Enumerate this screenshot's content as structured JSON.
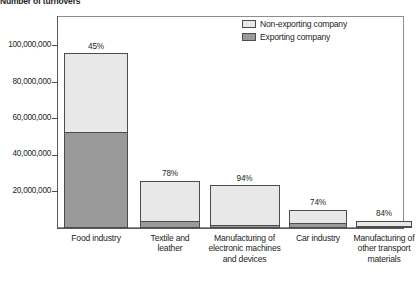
{
  "chart_data": {
    "type": "bar",
    "subtype": "stacked-vertical",
    "title": "Number of turnovers",
    "xlabel": "",
    "ylabel": "Number of turnovers",
    "ylim": [
      0,
      110000000
    ],
    "ytick_values": [
      20000000,
      40000000,
      60000000,
      80000000,
      100000000
    ],
    "ytick_labels": [
      "20,000,000",
      "40,000,000",
      "60,000,000",
      "80,000,000",
      "100,000,000"
    ],
    "grid": false,
    "legend_position": "top-right",
    "categories": [
      "Food industry",
      "Textile and leather",
      "Manufacturing of electronic machines and devices",
      "Car industry",
      "Manufacturing of other transport materials"
    ],
    "series": [
      {
        "name": "Non-exporting company",
        "color": "#e8e8e8",
        "values": [
          43000000,
          22700000,
          22100000,
          7400000,
          3400000
        ]
      },
      {
        "name": "Exporting company",
        "color": "#9a9a9a",
        "values": [
          53000000,
          3300000,
          1400000,
          2600000,
          600000
        ]
      }
    ],
    "totals": [
      96000000,
      26000000,
      23500000,
      10000000,
      4000000
    ],
    "data_labels": [
      "45%",
      "78%",
      "94%",
      "74%",
      "84%"
    ],
    "data_labels_meaning": "share of non-exporting company in total turnover"
  },
  "chart": {
    "title": "Number of turnovers",
    "y_axis": {
      "ticks": [
        {
          "label": "100,000,000",
          "value": 100000000
        },
        {
          "label": "80,000,000",
          "value": 80000000
        },
        {
          "label": "60,000,000",
          "value": 60000000
        },
        {
          "label": "40,000,000",
          "value": 40000000
        },
        {
          "label": "20,000,000",
          "value": 20000000
        }
      ]
    },
    "legend": [
      {
        "label": "Non-exporting company",
        "color": "#e8e8e8"
      },
      {
        "label": "Exporting company",
        "color": "#9a9a9a"
      }
    ],
    "bars": [
      {
        "category_lines": [
          "Food industry"
        ],
        "percent_label": "45%",
        "total": 96000000,
        "light_value": 43000000,
        "dark_value": 53000000
      },
      {
        "category_lines": [
          "Textile and",
          "leather"
        ],
        "percent_label": "78%",
        "total": 26000000,
        "light_value": 22700000,
        "dark_value": 3300000
      },
      {
        "category_lines": [
          "Manufacturing of",
          "electronic machines",
          "and devices"
        ],
        "percent_label": "94%",
        "total": 23500000,
        "light_value": 22100000,
        "dark_value": 1400000
      },
      {
        "category_lines": [
          "Car industry"
        ],
        "percent_label": "74%",
        "total": 10000000,
        "light_value": 7400000,
        "dark_value": 2600000
      },
      {
        "category_lines": [
          "Manufacturing of",
          "other transport",
          "materials"
        ],
        "percent_label": "84%",
        "total": 4000000,
        "light_value": 3400000,
        "dark_value": 600000
      }
    ]
  }
}
